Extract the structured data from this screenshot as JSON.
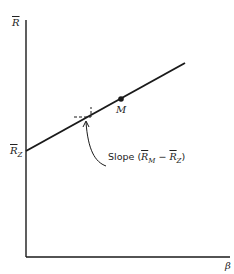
{
  "diagram": {
    "y_axis_label": "R",
    "x_axis_label": "β",
    "intercept_label": "R",
    "intercept_sub": "Z",
    "point_label": "M",
    "slope_text": "Slope",
    "slope_expr": {
      "a": "R",
      "a_sub": "M",
      "op": "−",
      "b": "R",
      "b_sub": "Z"
    },
    "colors": {
      "line": "#1a1a1a",
      "background": "#ffffff"
    }
  }
}
